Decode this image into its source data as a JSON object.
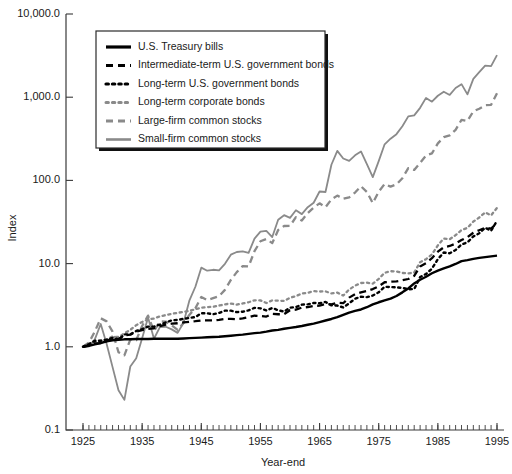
{
  "chart_data": {
    "type": "line",
    "title": "",
    "xlabel": "Year-end",
    "ylabel": "Index",
    "yscale": "log",
    "ylim": [
      0.1,
      10000
    ],
    "xlim": [
      1925,
      1995
    ],
    "grid": false,
    "legend_position": "upper-left",
    "ytick_labels": [
      "10,000.0",
      "1,000.0",
      "100.0",
      "10.0",
      "1.0",
      "0.1"
    ],
    "ytick_values": [
      10000,
      1000,
      100,
      10,
      1,
      0.1
    ],
    "xtick_labels": [
      "1925",
      "1935",
      "1945",
      "1955",
      "1965",
      "1975",
      "1985",
      "1995"
    ],
    "xtick_values": [
      1925,
      1935,
      1945,
      1955,
      1965,
      1975,
      1985,
      1995
    ],
    "x_minor_tick_step": 1,
    "colors": {
      "black": "#000000",
      "gray": "#8a8a8a",
      "axis": "#3a3a3a",
      "background": "#ffffff"
    },
    "x": [
      1925,
      1926,
      1927,
      1928,
      1929,
      1930,
      1931,
      1932,
      1933,
      1934,
      1935,
      1936,
      1937,
      1938,
      1939,
      1940,
      1941,
      1942,
      1943,
      1944,
      1945,
      1946,
      1947,
      1948,
      1949,
      1950,
      1951,
      1952,
      1953,
      1954,
      1955,
      1956,
      1957,
      1958,
      1959,
      1960,
      1961,
      1962,
      1963,
      1964,
      1965,
      1966,
      1967,
      1968,
      1969,
      1970,
      1971,
      1972,
      1973,
      1974,
      1975,
      1976,
      1977,
      1978,
      1979,
      1980,
      1981,
      1982,
      1983,
      1984,
      1985,
      1986,
      1987,
      1988,
      1989,
      1990,
      1991,
      1992,
      1993,
      1994,
      1995
    ],
    "series": [
      {
        "name": "U.S. Treasury bills",
        "style": "solid",
        "color": "#000000",
        "values": [
          1.0,
          1.03,
          1.07,
          1.11,
          1.16,
          1.2,
          1.21,
          1.23,
          1.23,
          1.24,
          1.24,
          1.24,
          1.25,
          1.25,
          1.25,
          1.25,
          1.25,
          1.26,
          1.27,
          1.28,
          1.29,
          1.3,
          1.31,
          1.32,
          1.34,
          1.36,
          1.38,
          1.4,
          1.43,
          1.46,
          1.48,
          1.52,
          1.57,
          1.6,
          1.65,
          1.69,
          1.73,
          1.78,
          1.84,
          1.9,
          1.98,
          2.07,
          2.16,
          2.27,
          2.42,
          2.58,
          2.7,
          2.81,
          2.99,
          3.23,
          3.43,
          3.61,
          3.8,
          4.08,
          4.51,
          5.02,
          5.78,
          6.4,
          6.95,
          7.65,
          8.25,
          8.75,
          9.25,
          9.9,
          10.72,
          11.0,
          11.4,
          11.7,
          11.95,
          12.2,
          12.45
        ]
      },
      {
        "name": "Intermediate-term U.S. government bonds",
        "style": "dashed",
        "color": "#000000",
        "values": [
          1.0,
          1.05,
          1.1,
          1.11,
          1.17,
          1.27,
          1.24,
          1.37,
          1.4,
          1.52,
          1.59,
          1.64,
          1.67,
          1.77,
          1.85,
          1.9,
          1.92,
          1.96,
          2.0,
          2.03,
          2.07,
          2.08,
          2.08,
          2.11,
          2.16,
          2.17,
          2.15,
          2.19,
          2.27,
          2.37,
          2.35,
          2.31,
          2.49,
          2.46,
          2.47,
          2.75,
          2.8,
          2.96,
          3.0,
          3.11,
          3.12,
          3.27,
          3.23,
          3.39,
          3.34,
          3.9,
          4.3,
          4.51,
          4.68,
          4.94,
          5.34,
          5.97,
          6.06,
          6.12,
          6.3,
          6.53,
          7.12,
          9.2,
          10.1,
          11.6,
          13.9,
          15.7,
          16.3,
          17.4,
          19.2,
          20.8,
          23.5,
          25.2,
          27.0,
          26.4,
          30.5
        ]
      },
      {
        "name": "Long-term U.S. government bonds",
        "style": "dotted",
        "color": "#000000",
        "values": [
          1.0,
          1.08,
          1.18,
          1.18,
          1.22,
          1.28,
          1.21,
          1.41,
          1.41,
          1.55,
          1.63,
          1.75,
          1.75,
          1.85,
          1.96,
          2.08,
          2.1,
          2.17,
          2.22,
          2.28,
          2.53,
          2.53,
          2.46,
          2.55,
          2.72,
          2.72,
          2.61,
          2.64,
          2.74,
          2.94,
          2.9,
          2.73,
          2.93,
          2.75,
          2.65,
          2.95,
          3.0,
          3.21,
          3.24,
          3.36,
          3.34,
          3.46,
          3.15,
          3.13,
          2.97,
          3.33,
          3.78,
          4.0,
          3.95,
          4.13,
          4.52,
          5.27,
          5.23,
          5.17,
          5.11,
          4.92,
          4.95,
          6.88,
          7.5,
          8.7,
          11.3,
          13.6,
          13.3,
          14.6,
          17.0,
          18.0,
          21.2,
          23.2,
          27.0,
          24.8,
          32.7
        ]
      },
      {
        "name": "Long-term corporate bonds",
        "style": "dotted",
        "color": "#8a8a8a",
        "values": [
          1.0,
          1.07,
          1.15,
          1.19,
          1.23,
          1.33,
          1.31,
          1.45,
          1.6,
          1.82,
          1.99,
          2.13,
          2.19,
          2.32,
          2.41,
          2.49,
          2.56,
          2.63,
          2.7,
          2.83,
          2.95,
          3.0,
          3.02,
          3.13,
          3.24,
          3.31,
          3.21,
          3.32,
          3.43,
          3.62,
          3.61,
          3.36,
          3.62,
          3.58,
          3.56,
          3.88,
          4.06,
          4.37,
          4.46,
          4.66,
          4.62,
          4.64,
          4.38,
          4.48,
          4.13,
          4.88,
          5.43,
          5.84,
          5.9,
          5.73,
          6.55,
          7.75,
          8.1,
          8.05,
          7.72,
          7.62,
          7.82,
          10.4,
          11.3,
          12.9,
          16.6,
          20.0,
          19.6,
          22.0,
          25.3,
          26.9,
          32.0,
          35.8,
          41.2,
          38.0,
          46.8
        ]
      },
      {
        "name": "Large-firm common stocks",
        "style": "dashed",
        "color": "#8a8a8a",
        "values": [
          1.0,
          1.12,
          1.53,
          2.2,
          2.02,
          1.52,
          0.86,
          0.79,
          1.22,
          1.2,
          1.78,
          2.37,
          1.54,
          2.02,
          2.01,
          1.81,
          1.6,
          1.93,
          2.43,
          2.91,
          3.96,
          3.64,
          3.85,
          4.06,
          4.83,
          6.36,
          7.89,
          9.34,
          9.25,
          14.11,
          18.56,
          19.78,
          17.64,
          25.3,
          28.32,
          28.45,
          36.11,
          32.96,
          40.47,
          47.14,
          53.01,
          47.67,
          59.1,
          65.64,
          60.06,
          62.46,
          71.41,
          84.96,
          72.5,
          53.31,
          73.14,
          90.58,
          84.08,
          89.59,
          106.11,
          140.51,
          133.61,
          162.43,
          199.08,
          211.6,
          278.6,
          330.7,
          348.1,
          405.8,
          534.0,
          517.5,
          675.6,
          727.4,
          800.1,
          810.5,
          1113.9
        ]
      },
      {
        "name": "Small-firm common stocks",
        "style": "solid",
        "color": "#8a8a8a",
        "values": [
          1.0,
          1.01,
          1.23,
          1.88,
          1.08,
          0.57,
          0.3,
          0.23,
          0.58,
          0.73,
          1.27,
          2.25,
          1.25,
          1.72,
          1.74,
          1.62,
          1.47,
          1.94,
          3.62,
          5.27,
          8.94,
          8.22,
          8.43,
          8.3,
          9.94,
          12.8,
          13.79,
          14.05,
          13.49,
          19.98,
          24.18,
          24.78,
          20.87,
          33.73,
          38.2,
          35.5,
          43.71,
          39.32,
          47.64,
          53.92,
          73.5,
          72.49,
          154.22,
          226.2,
          183.4,
          171.4,
          200.3,
          223.0,
          156.5,
          109.6,
          170.6,
          271.4,
          317.3,
          359.6,
          447.7,
          588.2,
          605.3,
          745.3,
          980.7,
          883.4,
          1040.6,
          1163.2,
          1064.6,
          1290.7,
          1435.5,
          1081.8,
          1657.8,
          1999.0,
          2395.0,
          2365.7,
          3204.0
        ]
      }
    ]
  },
  "legend": {
    "entries": [
      {
        "label": "U.S. Treasury bills",
        "sample": "solid-black-line"
      },
      {
        "label": "Intermediate-term U.S. government bonds",
        "sample": "dashed-black-line"
      },
      {
        "label": "Long-term U.S. government bonds",
        "sample": "dotted-black-line"
      },
      {
        "label": "Long-term corporate bonds",
        "sample": "dotted-gray-line"
      },
      {
        "label": "Large-firm common stocks",
        "sample": "dashed-gray-line"
      },
      {
        "label": "Small-firm common stocks",
        "sample": "solid-gray-line"
      }
    ]
  }
}
